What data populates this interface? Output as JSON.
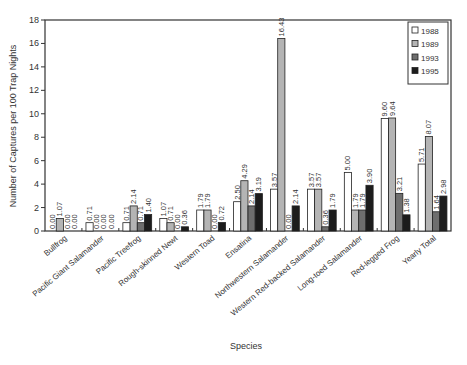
{
  "chart_data": {
    "type": "bar",
    "title": "",
    "xlabel": "Species",
    "ylabel": "Number of Captures per 100 Trap Nights",
    "ylim": [
      0,
      18
    ],
    "yticks": [
      0,
      2,
      4,
      6,
      8,
      10,
      12,
      14,
      16,
      18
    ],
    "grid": false,
    "legend_position": "upper right",
    "categories": [
      "Bullfrog",
      "Pacific Giant Salamander",
      "Pacific Treefrog",
      "Rough-skinned Newt",
      "Western Toad",
      "Ensatina",
      "Northwestern Salamander",
      "Western Red-backed Salamander",
      "Long-toed Salamander",
      "Red-legged Frog",
      "Yearly Total"
    ],
    "series": [
      {
        "name": "1988",
        "color": "#ffffff",
        "values": [
          0.0,
          0.71,
          0.71,
          1.07,
          1.79,
          2.5,
          3.57,
          3.57,
          5.0,
          9.6,
          5.71
        ]
      },
      {
        "name": "1989",
        "color": "#b4b4b4",
        "values": [
          1.07,
          0.0,
          2.14,
          0.71,
          1.79,
          4.29,
          16.43,
          3.57,
          1.79,
          9.64,
          8.07
        ]
      },
      {
        "name": "1993",
        "color": "#6e6e6e",
        "values": [
          0.0,
          0.0,
          0.71,
          0.0,
          0.0,
          2.14,
          0.0,
          0.36,
          1.79,
          3.21,
          1.64
        ]
      },
      {
        "name": "1995",
        "color": "#1c1c1c",
        "values": [
          0.0,
          0.0,
          1.4,
          0.36,
          0.72,
          3.19,
          2.14,
          1.79,
          3.9,
          1.38,
          2.98
        ]
      }
    ]
  }
}
